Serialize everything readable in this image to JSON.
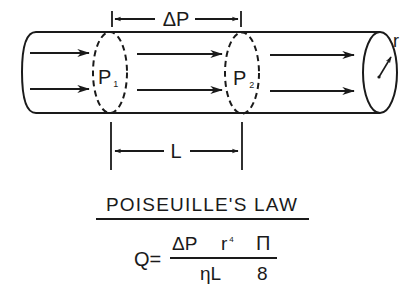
{
  "diagram": {
    "title": "POISEUILLE'S LAW",
    "pressure_difference_label": "ΔP",
    "length_label": "L",
    "radius_label": "r",
    "point1": {
      "main": "P",
      "sub": "1"
    },
    "point2": {
      "main": "P",
      "sub": "2"
    },
    "equation": {
      "lhs": "Q=",
      "numerator_dp": "ΔP",
      "numerator_r": "r",
      "numerator_r_exp": "4",
      "numerator_pi": "Π",
      "denominator_eta_l": "ηL",
      "denominator_8": "8"
    },
    "colors": {
      "ink": "#1a1a1a",
      "background": "#ffffff"
    }
  }
}
